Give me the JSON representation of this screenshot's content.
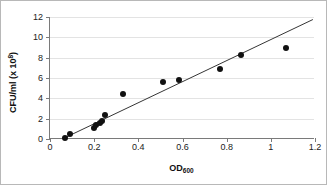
{
  "chart_data": {
    "type": "scatter",
    "title": "",
    "xlabel": "OD600",
    "xlabel_base": "OD",
    "xlabel_sub": "600",
    "ylabel": "CFU/ml (x 108)",
    "ylabel_base": "CFU/ml (x 10",
    "ylabel_sup": "8",
    "ylabel_tail": ")",
    "xlim": [
      0,
      1.2
    ],
    "ylim": [
      0,
      12
    ],
    "xticks": [
      0,
      0.2,
      0.4,
      0.6,
      0.8,
      1,
      1.2
    ],
    "xticklabels": [
      "0",
      "0.2",
      "0.4",
      "0.6",
      "0.8",
      "1",
      "1.2"
    ],
    "yticks": [
      0,
      2,
      4,
      6,
      8,
      10,
      12
    ],
    "yticklabels": [
      "0",
      "2",
      "4",
      "6",
      "8",
      "10",
      "12"
    ],
    "grid": "horizontal",
    "legend": "none",
    "marker_color": "#111111",
    "grid_color": "#e3e3e3",
    "axis_color": "#7a7a7a",
    "points": [
      {
        "x": 0.07,
        "y": 0.05
      },
      {
        "x": 0.09,
        "y": 0.5
      },
      {
        "x": 0.2,
        "y": 1.1
      },
      {
        "x": 0.21,
        "y": 1.35
      },
      {
        "x": 0.225,
        "y": 1.6
      },
      {
        "x": 0.235,
        "y": 1.75
      },
      {
        "x": 0.25,
        "y": 2.4
      },
      {
        "x": 0.33,
        "y": 4.4
      },
      {
        "x": 0.51,
        "y": 5.65
      },
      {
        "x": 0.585,
        "y": 5.8
      },
      {
        "x": 0.77,
        "y": 6.9
      },
      {
        "x": 0.865,
        "y": 8.25
      },
      {
        "x": 1.07,
        "y": 9.0
      }
    ],
    "trendline": {
      "type": "linear",
      "x_start": 0.065,
      "y_start": 0.0,
      "x_end": 1.195,
      "y_end": 11.75,
      "color": "#333333"
    }
  }
}
